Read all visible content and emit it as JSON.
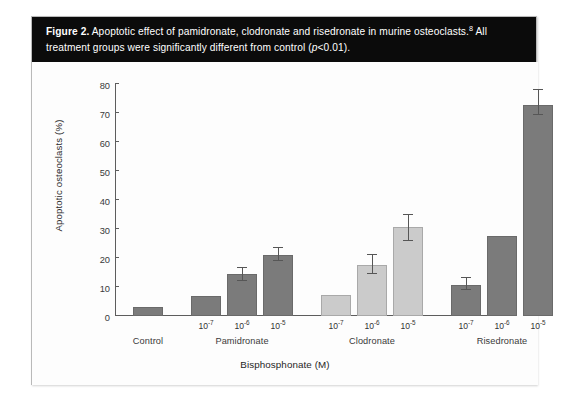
{
  "figure": {
    "label": "Figure 2.",
    "caption_part1": " Apoptotic effect of pamidronate, clodronate and risedronate in murine osteoclasts.",
    "superscript": "8",
    "caption_part2": " All treatment groups were significantly different from control (",
    "caption_italic": "p",
    "caption_part3": "<0.01)."
  },
  "chart_data": {
    "type": "bar",
    "title": "Apoptotic effect of pamidronate, clodronate and risedronate in murine osteoclasts",
    "xlabel": "Bisphosphonate (M)",
    "ylabel": "Apoptotic osteoclasts (%)",
    "ylim": [
      0,
      80
    ],
    "yticks": [
      0,
      10,
      20,
      30,
      40,
      50,
      60,
      70,
      80
    ],
    "grid": false,
    "legend": "none",
    "groups": [
      {
        "name": "Control",
        "color": "#7b7b7b",
        "bars": [
          {
            "concentration": "",
            "value": 3.2,
            "error_low": null,
            "error_high": null
          }
        ]
      },
      {
        "name": "Pamidronate",
        "color": "#7b7b7b",
        "bars": [
          {
            "concentration": "10-7",
            "base": "10",
            "exponent": "-7",
            "value": 6.8,
            "error_low": null,
            "error_high": null
          },
          {
            "concentration": "10-6",
            "base": "10",
            "exponent": "-6",
            "value": 14.4,
            "error_low": 12.2,
            "error_high": 16.6
          },
          {
            "concentration": "10-5",
            "base": "10",
            "exponent": "-5",
            "value": 21.0,
            "error_low": 19.0,
            "error_high": 23.4
          }
        ]
      },
      {
        "name": "Clodronate",
        "color": "#cbcbcb",
        "bars": [
          {
            "concentration": "10-7",
            "base": "10",
            "exponent": "-7",
            "value": 7.2,
            "error_low": null,
            "error_high": null
          },
          {
            "concentration": "10-6",
            "base": "10",
            "exponent": "-6",
            "value": 17.5,
            "error_low": 14.5,
            "error_high": 21.0
          },
          {
            "concentration": "10-5",
            "base": "10",
            "exponent": "-5",
            "value": 30.6,
            "error_low": 26.0,
            "error_high": 35.0
          }
        ]
      },
      {
        "name": "Risedronate",
        "color": "#7b7b7b",
        "bars": [
          {
            "concentration": "10-7",
            "base": "10",
            "exponent": "-7",
            "value": 10.8,
            "error_low": 8.8,
            "error_high": 13.0
          },
          {
            "concentration": "10-6",
            "base": "10",
            "exponent": "-6",
            "value": 27.6,
            "error_low": null,
            "error_high": null
          },
          {
            "concentration": "10-5",
            "base": "10",
            "exponent": "-5",
            "value": 72.8,
            "error_low": 69.2,
            "error_high": 77.8
          }
        ]
      }
    ],
    "colors": {
      "dark_gray": "#7b7b7b",
      "light_gray": "#cbcbcb",
      "axis": "#5d5d5d",
      "caption_band": "#0b0b0b"
    }
  }
}
